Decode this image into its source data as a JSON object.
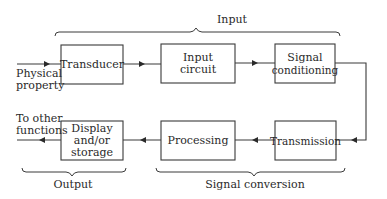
{
  "diagram": {
    "blocks": {
      "transducer": "Transducer",
      "input_circuit_1": "Input",
      "input_circuit_2": "circuit",
      "signal_conditioning_1": "Signal",
      "signal_conditioning_2": "conditioning",
      "transmission": "Transmission",
      "processing": "Processing",
      "display_1": "Display",
      "display_2": "and/or",
      "display_3": "storage"
    },
    "io": {
      "input_label_1": "Physical",
      "input_label_2": "property",
      "output_label_1": "To other",
      "output_label_2": "functions"
    },
    "groups": {
      "input": "Input",
      "output": "Output",
      "signal_conversion": "Signal conversion"
    },
    "colors": {
      "stroke": "#3a3a3a",
      "text": "#2a2a2a",
      "background": "#ffffff"
    }
  }
}
